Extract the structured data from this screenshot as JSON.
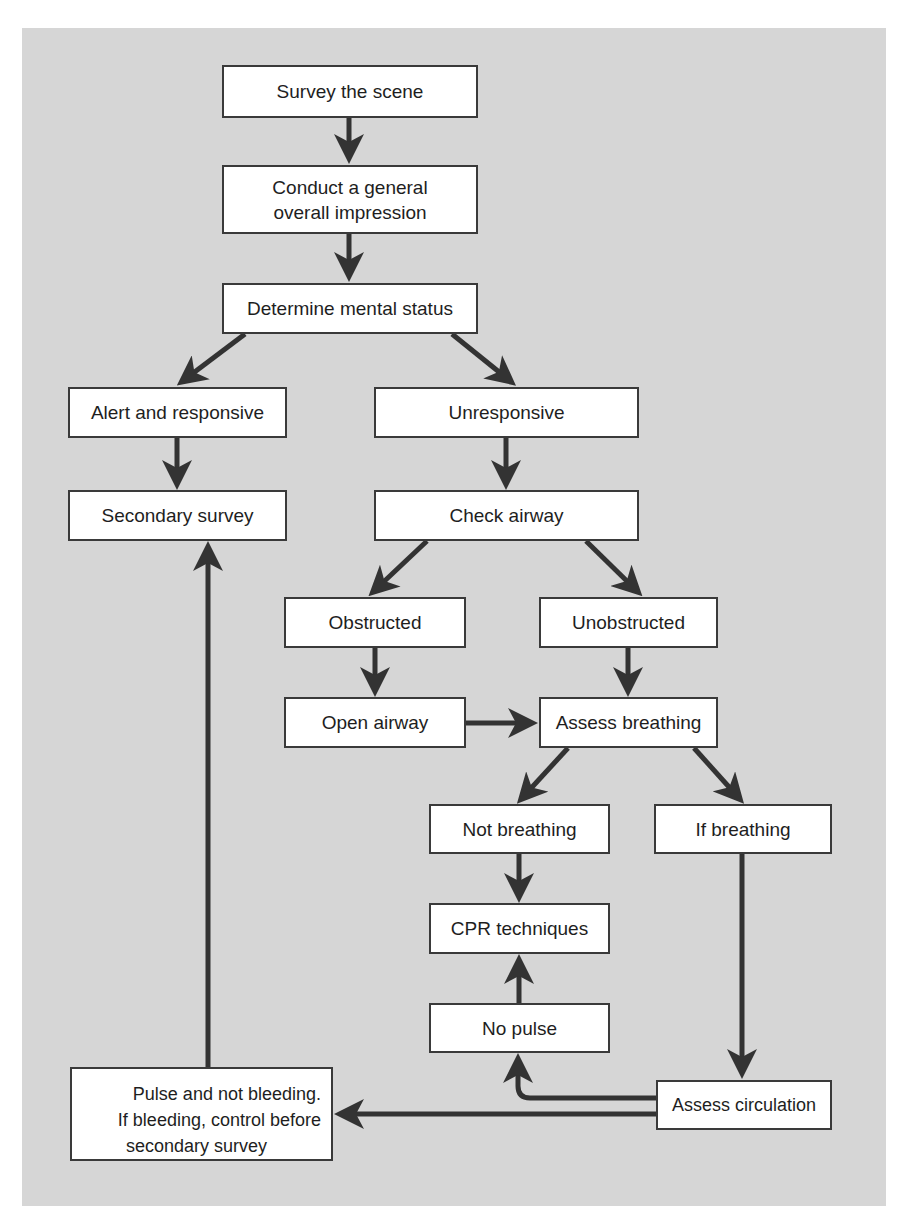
{
  "diagram": {
    "type": "flowchart",
    "nodes": {
      "survey_scene": "Survey the scene",
      "general_impression_line1": "Conduct a general",
      "general_impression_line2": "overall impression",
      "mental_status": "Determine mental status",
      "alert_responsive": "Alert and responsive",
      "unresponsive": "Unresponsive",
      "secondary_survey": "Secondary survey",
      "check_airway": "Check airway",
      "obstructed": "Obstructed",
      "unobstructed": "Unobstructed",
      "open_airway": "Open airway",
      "assess_breathing": "Assess breathing",
      "not_breathing": "Not breathing",
      "if_breathing": "If breathing",
      "cpr_techniques": "CPR techniques",
      "no_pulse": "No pulse",
      "assess_circulation": "Assess circulation",
      "pulse_not_bleeding_line1": "Pulse and not bleeding.",
      "pulse_not_bleeding_line2": "If bleeding, control before",
      "pulse_not_bleeding_line3": "secondary survey"
    },
    "edges": [
      [
        "Survey the scene",
        "Conduct a general overall impression"
      ],
      [
        "Conduct a general overall impression",
        "Determine mental status"
      ],
      [
        "Determine mental status",
        "Alert and responsive"
      ],
      [
        "Determine mental status",
        "Unresponsive"
      ],
      [
        "Alert and responsive",
        "Secondary survey"
      ],
      [
        "Unresponsive",
        "Check airway"
      ],
      [
        "Check airway",
        "Obstructed"
      ],
      [
        "Check airway",
        "Unobstructed"
      ],
      [
        "Obstructed",
        "Open airway"
      ],
      [
        "Unobstructed",
        "Assess breathing"
      ],
      [
        "Open airway",
        "Assess breathing"
      ],
      [
        "Assess breathing",
        "Not breathing"
      ],
      [
        "Assess breathing",
        "If breathing"
      ],
      [
        "Not breathing",
        "CPR techniques"
      ],
      [
        "If breathing",
        "Assess circulation"
      ],
      [
        "Assess circulation",
        "No pulse"
      ],
      [
        "No pulse",
        "CPR techniques"
      ],
      [
        "Assess circulation",
        "Pulse and not bleeding. If bleeding, control before secondary survey"
      ],
      [
        "Pulse and not bleeding. If bleeding, control before secondary survey",
        "Secondary survey"
      ]
    ],
    "colors": {
      "background": "#d6d6d6",
      "box_fill": "#ffffff",
      "stroke": "#3a3a3a"
    }
  }
}
